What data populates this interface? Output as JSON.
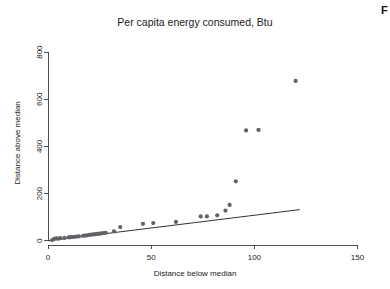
{
  "figure": {
    "corner_label": "F"
  },
  "chart_data": {
    "type": "scatter",
    "title": "Per capita energy consumed, Btu",
    "xlabel": "Distance below median",
    "ylabel": "Distance above median",
    "xlim": [
      0,
      157
    ],
    "ylim": [
      -18,
      860
    ],
    "xticks": [
      0,
      50,
      100,
      150
    ],
    "yticks": [
      0,
      200,
      400,
      600,
      800
    ],
    "xtick_labels": [
      "0",
      "50",
      "100",
      "150"
    ],
    "ytick_labels": [
      "0",
      "200",
      "400",
      "600",
      "800"
    ],
    "grid": false,
    "legend": null,
    "point_color": "#5f6368",
    "point_radius": 2.1,
    "series": [
      {
        "name": "quantile-quantile points",
        "x": [
          2,
          3,
          4,
          5,
          6,
          8,
          10,
          11,
          12,
          13,
          14,
          15,
          17,
          18,
          19,
          20,
          21,
          22,
          23,
          24,
          25,
          26,
          27,
          28,
          32,
          35,
          46,
          51,
          62,
          74,
          77,
          82,
          86,
          88,
          91,
          96,
          102,
          120
        ],
        "y": [
          3,
          8,
          10,
          9,
          11,
          12,
          14,
          15,
          16,
          17,
          18,
          19,
          21,
          22,
          23,
          25,
          26,
          27,
          28,
          29,
          30,
          31,
          33,
          34,
          40,
          58,
          72,
          75,
          80,
          103,
          103,
          108,
          128,
          152,
          252,
          468,
          470,
          678
        ]
      }
    ],
    "reference_line": {
      "name": "45-degree reference line",
      "x0": 0,
      "y0": 0,
      "x1": 122,
      "y1": 132
    }
  }
}
